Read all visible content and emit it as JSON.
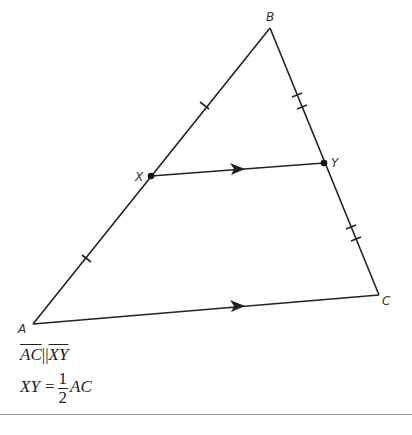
{
  "points": {
    "A": {
      "label": "A",
      "x": 33,
      "y": 324
    },
    "B": {
      "label": "B",
      "x": 270,
      "y": 28
    },
    "C": {
      "label": "C",
      "x": 379,
      "y": 295
    },
    "X": {
      "label": "X",
      "x": 151,
      "y": 176
    },
    "Y": {
      "label": "Y",
      "x": 324,
      "y": 163
    }
  },
  "segments": [
    "AB",
    "BC",
    "AC",
    "XY"
  ],
  "markings": {
    "AX_XB": "single tick (congruent)",
    "BY_YC": "double tick (congruent)",
    "AC_XY": "single arrow (parallel)"
  },
  "given": {
    "line1_left": "AC",
    "line1_sym": "||",
    "line1_right": "XY",
    "line2_left": "XY =",
    "line2_num": "1",
    "line2_den": "2",
    "line2_right": "AC"
  }
}
